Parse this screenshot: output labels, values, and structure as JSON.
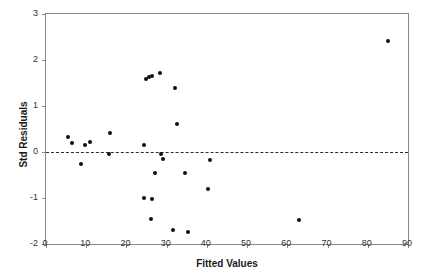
{
  "chart_data": {
    "type": "scatter",
    "title": "",
    "xlabel": "Fitted Values",
    "ylabel": "Std Residuals",
    "xlim": [
      0,
      90
    ],
    "ylim": [
      -2,
      3
    ],
    "xticks": [
      0,
      10,
      20,
      30,
      40,
      50,
      60,
      70,
      80,
      90
    ],
    "yticks": [
      -2,
      -1,
      0,
      1,
      2,
      3
    ],
    "grid": false,
    "legend": null,
    "reference_line": {
      "orientation": "horizontal",
      "y": 0,
      "style": "dashed",
      "color": "#2b2b2b"
    },
    "marker": {
      "shape": "circle",
      "color": "#111111",
      "size": 4
    },
    "series": [
      {
        "name": "Standardized residuals",
        "points": [
          {
            "x": 5.5,
            "y": 0.33
          },
          {
            "x": 6.4,
            "y": 0.2
          },
          {
            "x": 8.8,
            "y": -0.25
          },
          {
            "x": 9.6,
            "y": 0.15
          },
          {
            "x": 11.0,
            "y": 0.21
          },
          {
            "x": 15.7,
            "y": -0.04
          },
          {
            "x": 16.0,
            "y": 0.42
          },
          {
            "x": 24.3,
            "y": 0.16
          },
          {
            "x": 24.4,
            "y": -1.01
          },
          {
            "x": 24.8,
            "y": 1.59
          },
          {
            "x": 25.7,
            "y": 1.64
          },
          {
            "x": 26.1,
            "y": -1.45
          },
          {
            "x": 26.3,
            "y": 1.66
          },
          {
            "x": 26.4,
            "y": -1.03
          },
          {
            "x": 27.2,
            "y": -0.45
          },
          {
            "x": 28.4,
            "y": 1.71
          },
          {
            "x": 28.7,
            "y": -0.05
          },
          {
            "x": 29.0,
            "y": -0.15
          },
          {
            "x": 31.5,
            "y": -1.7
          },
          {
            "x": 32.0,
            "y": 1.39
          },
          {
            "x": 32.5,
            "y": 0.61
          },
          {
            "x": 34.6,
            "y": -0.45
          },
          {
            "x": 35.4,
            "y": -1.73
          },
          {
            "x": 40.2,
            "y": -0.8
          },
          {
            "x": 40.8,
            "y": -0.17
          },
          {
            "x": 62.9,
            "y": -1.47
          },
          {
            "x": 85.0,
            "y": 2.41
          }
        ]
      }
    ]
  }
}
